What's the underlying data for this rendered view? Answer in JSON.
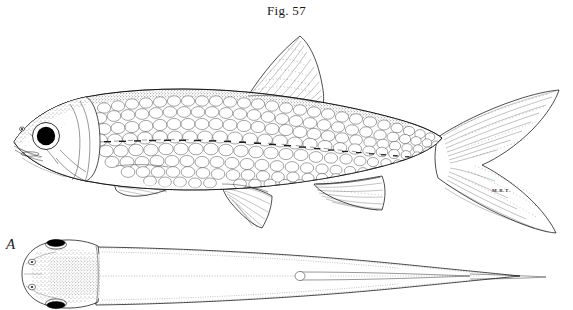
{
  "plate": {
    "figure_caption": "Fig. 57",
    "panel_label": "A",
    "artist_signature": "M.B.T.",
    "background_color": "#ffffff",
    "ink_color": "#000000",
    "width": 573,
    "height": 310
  },
  "main_figure": {
    "name": "lateral-view-fish",
    "description": "Lateral view of an elongate cyprinid fish facing left, rendered in pen-and-ink stipple and line",
    "orientation": "facing-left",
    "features": [
      {
        "name": "eye",
        "render": "large solid black circle with white ring"
      },
      {
        "name": "snout",
        "render": "pointed, stippled"
      },
      {
        "name": "mouth",
        "render": "subterminal slit"
      },
      {
        "name": "nostril",
        "render": "small oval above snout"
      },
      {
        "name": "operculum",
        "render": "curved gill-cover outline"
      },
      {
        "name": "lateral-line",
        "render": "dashed midline through scale rows"
      },
      {
        "name": "scales",
        "render": "overlapping cycloid scale rows"
      },
      {
        "name": "dorsal-fin",
        "render": "triangular, radiating rays"
      },
      {
        "name": "pectoral-fin",
        "render": "elongate, radiating rays"
      },
      {
        "name": "pelvic-fin",
        "render": "triangular, radiating rays"
      },
      {
        "name": "anal-fin",
        "render": "triangular, radiating rays"
      },
      {
        "name": "caudal-fin",
        "render": "deeply forked, radiating rays"
      }
    ]
  },
  "panel_a": {
    "name": "dorsal-view-head",
    "description": "Dorsal view of the same fish showing head from above with paired eyes and stippled crown",
    "features": [
      {
        "name": "left-eye",
        "render": "elongate black oval on upper margin"
      },
      {
        "name": "right-eye",
        "render": "elongate black oval on lower margin"
      },
      {
        "name": "anterior-nostril",
        "render": "small circle"
      },
      {
        "name": "posterior-nostril",
        "render": "small circle"
      },
      {
        "name": "crown-stippling",
        "render": "dense dot shading over snout and skull"
      },
      {
        "name": "body-taper",
        "render": "long tapering trunk with dotted margins"
      },
      {
        "name": "median-ridge",
        "render": "central dotted line along trunk"
      }
    ]
  }
}
